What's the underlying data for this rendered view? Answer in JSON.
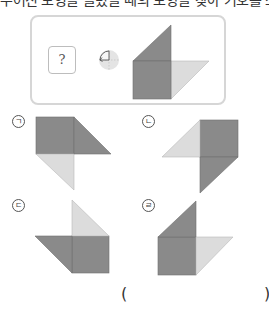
{
  "instruction": "주어진 도형을 돌렸을 때의 모양을 찾아 기호를 쓰세요.",
  "question": {
    "placeholder_symbol": "?",
    "rotation_icon": "rotate-counterclockwise-90-icon",
    "rotation": "counterclockwise 90°"
  },
  "colors": {
    "dark": "#8a8a8a",
    "light": "#dcdcdc",
    "edge": "#6f6f6f"
  },
  "options": [
    {
      "label": "ㄱ",
      "id": "a"
    },
    {
      "label": "ㄴ",
      "id": "b"
    },
    {
      "label": "ㄷ",
      "id": "c"
    },
    {
      "label": "ㄹ",
      "id": "d"
    }
  ],
  "answer": {
    "open_paren": "(",
    "value": "",
    "close_paren": ")"
  }
}
